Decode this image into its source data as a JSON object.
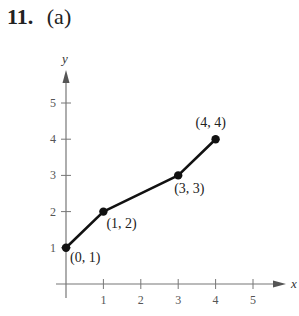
{
  "header": {
    "problem_number": "11.",
    "part": "(a)"
  },
  "chart_data": {
    "type": "line",
    "title": "",
    "xlabel": "x",
    "ylabel": "y",
    "xlim": [
      0,
      5.5
    ],
    "ylim": [
      0,
      5.5
    ],
    "xticks": [
      1,
      2,
      3,
      4,
      5
    ],
    "yticks": [
      1,
      2,
      3,
      4,
      5
    ],
    "grid": false,
    "legend": null,
    "series": [
      {
        "name": "polyline",
        "x": [
          0,
          1,
          3,
          4
        ],
        "y": [
          1,
          2,
          3,
          4
        ],
        "markers": true,
        "color": "#111111"
      }
    ],
    "annotations": [
      {
        "text": "(0, 1)",
        "x": 0,
        "y": 1
      },
      {
        "text": "(1, 2)",
        "x": 1,
        "y": 2
      },
      {
        "text": "(3, 3)",
        "x": 3,
        "y": 3
      },
      {
        "text": "(4, 4)",
        "x": 4,
        "y": 4
      }
    ]
  }
}
